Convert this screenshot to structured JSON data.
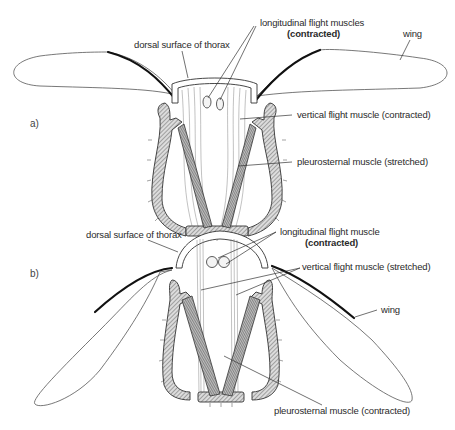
{
  "figure": {
    "panels": [
      {
        "id": "a",
        "label": "a)",
        "state": "wings raised",
        "labels": {
          "dorsal_surface": "dorsal surface of thorax",
          "longitudinal_line1": "longitudinal flight muscles",
          "longitudinal_line2": "(contracted)",
          "wing": "wing",
          "vertical": "vertical flight muscle (contracted)",
          "pleurosternal": "pleurosternal muscle (stretched)"
        }
      },
      {
        "id": "b",
        "label": "b)",
        "state": "wings lowered",
        "labels": {
          "dorsal_surface": "dorsal surface of thorax",
          "longitudinal_line1": "longitudinal flight muscle",
          "longitudinal_line2": "(contracted)",
          "vertical": "vertical flight muscle (stretched)",
          "wing": "wing",
          "pleurosternal": "pleurosternal muscle (contracted)"
        }
      }
    ]
  },
  "colors": {
    "background": "#ffffff",
    "ink": "#2a2a2a",
    "costa": "#111111"
  }
}
